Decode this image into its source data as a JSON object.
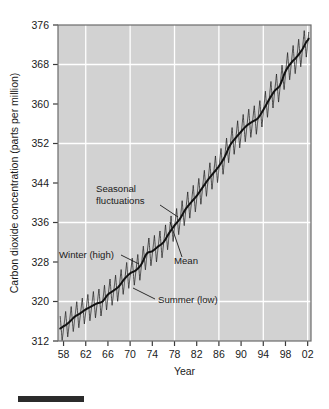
{
  "figure": {
    "background_color": "#ffffff",
    "plot_background_color": "#d2d2d2",
    "gridline_color": "#ffffff",
    "line_color": "#1d1d1d",
    "caption_bar": {
      "name": "caption-rule",
      "color": "#2b2b2b",
      "x": 18,
      "y": 396,
      "width": 66,
      "height": 6
    }
  },
  "chart_data": {
    "type": "line",
    "title": "",
    "subtitle": "",
    "xlabel": "Year",
    "ylabel": "Carbon dioxide concentration (parts per million)",
    "xlim": [
      1957.0,
      2002.6
    ],
    "ylim": [
      312,
      376
    ],
    "grid": true,
    "grid_axes": "both",
    "legend_position": "none",
    "x_tick_labels": [
      "58",
      "62",
      "66",
      "70",
      "74",
      "78",
      "82",
      "86",
      "90",
      "94",
      "98",
      "02"
    ],
    "x_tick_values": [
      1958,
      1962,
      1966,
      1970,
      1974,
      1978,
      1982,
      1986,
      1990,
      1994,
      1998,
      2002
    ],
    "x_gridline_values": [
      1962,
      1970,
      1978,
      1986,
      1994,
      2002
    ],
    "y_tick_labels": [
      "312",
      "320",
      "328",
      "336",
      "344",
      "352",
      "360",
      "368",
      "376"
    ],
    "y_tick_values": [
      312,
      320,
      328,
      336,
      344,
      352,
      360,
      368,
      376
    ],
    "y_gridline_values": [
      320,
      336,
      352,
      368
    ],
    "series": [
      {
        "name": "Mean",
        "description": "Smoothed annual mean atmospheric CO2 concentration (Mauna Loa)",
        "x": [
          1958,
          1959,
          1960,
          1961,
          1962,
          1963,
          1964,
          1965,
          1966,
          1967,
          1968,
          1969,
          1970,
          1971,
          1972,
          1973,
          1974,
          1975,
          1976,
          1977,
          1978,
          1979,
          1980,
          1981,
          1982,
          1983,
          1984,
          1985,
          1986,
          1987,
          1988,
          1989,
          1990,
          1991,
          1992,
          1993,
          1994,
          1995,
          1996,
          1997,
          1998,
          1999,
          2000,
          2001,
          2002
        ],
        "values": [
          315.0,
          315.8,
          316.9,
          317.6,
          318.4,
          319.0,
          319.6,
          320.0,
          321.4,
          322.2,
          323.1,
          324.6,
          325.7,
          326.3,
          327.5,
          329.7,
          330.2,
          331.1,
          332.0,
          333.8,
          335.4,
          336.8,
          338.7,
          340.1,
          341.4,
          343.0,
          344.6,
          346.0,
          347.4,
          349.2,
          351.6,
          353.1,
          354.4,
          355.6,
          356.4,
          357.1,
          358.8,
          360.8,
          362.6,
          363.8,
          366.6,
          368.3,
          369.5,
          371.0,
          372.9
        ]
      },
      {
        "name": "Seasonal fluctuations",
        "description": "Monthly sawtooth oscillation about the mean; winter peak (high) and summer trough (low)",
        "amplitude_ppm_1958": 5.5,
        "amplitude_ppm_2002": 6.2,
        "peak_phase_fraction_of_year": 0.38,
        "trough_phase_fraction_of_year": 0.75
      }
    ],
    "annotations": [
      {
        "name": "annotation-seasonal-fluctuations",
        "label_line1": "Seasonal",
        "label_line2": "fluctuations",
        "label": "Seasonal fluctuations",
        "text_x": 96,
        "text_y": 192,
        "leader_from": [
          160,
          205
        ],
        "leader_to": [
          178,
          217
        ]
      },
      {
        "name": "annotation-mean",
        "label": "Mean",
        "text_x": 174,
        "text_y": 264,
        "leader_from": [
          182,
          257
        ],
        "leader_to": [
          170,
          222
        ]
      },
      {
        "name": "annotation-winter-high",
        "label": "Winter (high)",
        "text_x": 59,
        "text_y": 258,
        "leader_from": [
          121,
          255
        ],
        "leader_to": [
          139,
          264
        ]
      },
      {
        "name": "annotation-summer-low",
        "label": "Summer (low)",
        "text_x": 158,
        "text_y": 303,
        "leader_from": [
          155,
          299
        ],
        "leader_to": [
          133,
          288
        ]
      }
    ]
  }
}
